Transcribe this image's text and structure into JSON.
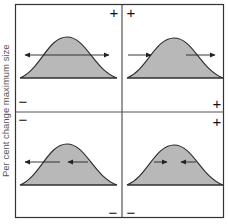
{
  "y_axis_label": "Per cent change maximum size",
  "colors": {
    "frame": "#333333",
    "curve_fill": "#b8b8b8",
    "curve_stroke": "#2a2a2a",
    "arrow": "#222222",
    "sign": "#111111"
  },
  "signs": {
    "top_left_plus": "+",
    "top_right_plus": "+",
    "left_upper_minus": "−",
    "left_lower_minus": "−",
    "right_upper_plus": "+",
    "right_lower_plus": "+",
    "bottom_left_minus": "−",
    "bottom_right_minus": "−"
  },
  "quadrants": [
    {
      "id": "top-left",
      "description": "Disruptive selection: arrows point outward from both sides",
      "arrows": [
        {
          "from": 60,
          "to": 24,
          "dir": "left"
        },
        {
          "from": 82,
          "to": 109,
          "dir": "right"
        }
      ]
    },
    {
      "id": "top-right",
      "description": "Directional shift toward larger size: both arrows point right",
      "arrows": [
        {
          "from": 128,
          "to": 151,
          "dir": "right"
        },
        {
          "from": 186,
          "to": 215,
          "dir": "right"
        }
      ]
    },
    {
      "id": "bottom-left",
      "description": "Directional shift toward smaller size: both arrows point left",
      "arrows": [
        {
          "from": 60,
          "to": 25,
          "dir": "left"
        },
        {
          "from": 88,
          "to": 68,
          "dir": "left"
        }
      ]
    },
    {
      "id": "bottom-right",
      "description": "Stabilising selection: arrows point inward",
      "arrows": [
        {
          "from": 154,
          "to": 167,
          "dir": "right"
        },
        {
          "from": 196,
          "to": 181,
          "dir": "left"
        }
      ]
    }
  ]
}
